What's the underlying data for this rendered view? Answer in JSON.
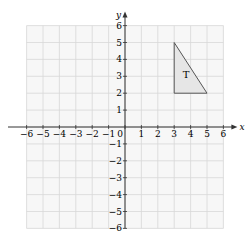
{
  "chart_data": {
    "type": "scatter",
    "title": "",
    "xlabel": "x",
    "ylabel": "y",
    "xlim": [
      -6,
      6
    ],
    "ylim": [
      -6,
      6
    ],
    "grid": true,
    "x_ticks": [
      "-6",
      "-5",
      "-4",
      "-3",
      "-2",
      "-1",
      "0",
      "1",
      "2",
      "3",
      "4",
      "5",
      "6"
    ],
    "y_ticks": [
      "-6",
      "-5",
      "-4",
      "-3",
      "-2",
      "-1",
      "1",
      "2",
      "3",
      "4",
      "5",
      "6"
    ],
    "shapes": [
      {
        "name": "T",
        "type": "triangle",
        "vertices": [
          [
            3,
            2
          ],
          [
            3,
            5
          ],
          [
            5,
            2
          ]
        ],
        "fill": "#e6e6e6",
        "stroke": "#555555"
      }
    ]
  }
}
